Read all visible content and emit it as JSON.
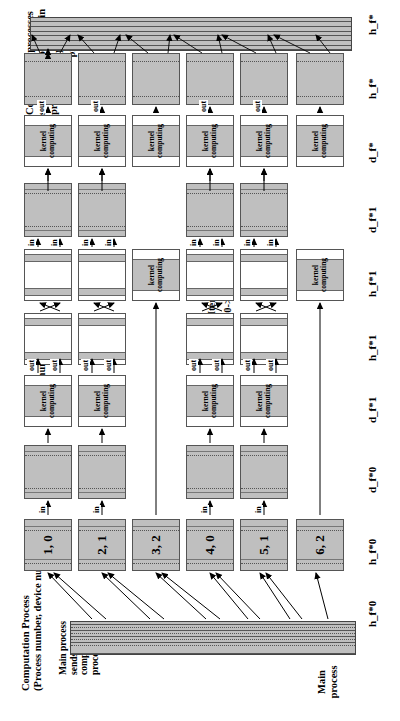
{
  "figure": {
    "title_top": "Computation processes\nsend results to the main\nprocess.",
    "label_mpi": "MPI communication",
    "label_comp_process": "Computation Process\n(Process number, device number)",
    "label_main_sends": "Main process\nsends data to\ncomputation\nprocesses.",
    "label_main_process": "Main\nprocess",
    "iterations_title": "Iterations",
    "iterations_expr": "f*1->f*0->f*1->. . ."
  },
  "stage_labels": {
    "h_f_star_top": "h_f*",
    "h_f_star_mid": "h_f*",
    "d_f_star": "d_f*",
    "d_f_star_1_right": "d_f*1",
    "h_f_star_1_b": "h_f*1",
    "h_f_star_1_a": "h_f*1",
    "d_f_star_1_left": "d_f*1",
    "d_f_star_0": "d_f*0",
    "h_f_star_0_proc": "h_f*0",
    "h_f_star_0_main": "h_f*0"
  },
  "kernel": {
    "text": "kernel\ncomputing"
  },
  "tags": {
    "in": "in",
    "out": "out"
  },
  "processes": [
    {
      "id": "p6",
      "label": "6, 2",
      "process_number": 6,
      "device_number": 2
    },
    {
      "id": "p5",
      "label": "5, 1",
      "process_number": 5,
      "device_number": 1
    },
    {
      "id": "p4",
      "label": "4, 0",
      "process_number": 4,
      "device_number": 0
    },
    {
      "id": "p3",
      "label": "3, 2",
      "process_number": 3,
      "device_number": 2
    },
    {
      "id": "p2",
      "label": "2, 1",
      "process_number": 2,
      "device_number": 1
    },
    {
      "id": "p1",
      "label": "1, 0",
      "process_number": 1,
      "device_number": 0
    }
  ],
  "colors": {
    "fill_grey": "#bfbfbf",
    "fill_white": "#ffffff",
    "stroke": "#555555",
    "background": "#ffffff"
  }
}
